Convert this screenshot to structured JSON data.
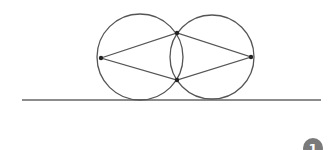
{
  "diagram": {
    "stroke_color": "#555555",
    "point_color": "#222222",
    "ground_line": {
      "x1": 22,
      "y1": 100,
      "x2": 321,
      "y2": 100
    },
    "circles": [
      {
        "name": "left-circle",
        "cx": 140,
        "cy": 57,
        "r": 43
      },
      {
        "name": "right-circle",
        "cx": 212,
        "cy": 57,
        "r": 42
      }
    ],
    "points": [
      {
        "name": "left-point",
        "x": 101,
        "y": 58
      },
      {
        "name": "top-intersection",
        "x": 177,
        "y": 33
      },
      {
        "name": "bottom-intersection",
        "x": 177,
        "y": 80
      },
      {
        "name": "right-point",
        "x": 251,
        "y": 57
      }
    ]
  },
  "badge": {
    "label": "1",
    "fill": "#7a7a7a",
    "text_color": "#ffffff"
  }
}
